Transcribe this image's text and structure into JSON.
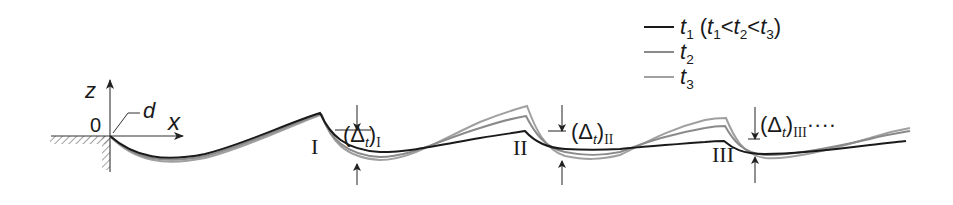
{
  "diagram": {
    "type": "water-surface profile over step/steps at successive times",
    "axes": {
      "z_label": "z",
      "x_label": "x",
      "origin_label": "0",
      "depth_label": "d"
    },
    "step_labels": [
      "I",
      "II",
      "III"
    ],
    "delta_labels": [
      {
        "base": "Δ",
        "sub_var": "t",
        "index": "I",
        "suffix": ""
      },
      {
        "base": "Δ",
        "sub_var": "t",
        "index": "II",
        "suffix": ""
      },
      {
        "base": "Δ",
        "sub_var": "t",
        "index": "III",
        "suffix": "····"
      }
    ],
    "legend": [
      {
        "var": "t",
        "sub": "1",
        "note": "(t1 < t2 < t3)",
        "color": "#1a1a1a"
      },
      {
        "var": "t",
        "sub": "2",
        "note": "",
        "color": "#8c8c8c"
      },
      {
        "var": "t",
        "sub": "3",
        "note": "",
        "color": "#9a9a9a"
      }
    ],
    "legend_note_parts": {
      "open": "(",
      "t1": "t",
      "s1": "1",
      "lt1": "<",
      "t2": "t",
      "s2": "2",
      "lt2": "<",
      "t3": "t",
      "s3": "3",
      "close": ")"
    },
    "colors": {
      "t1": "#1a1a1a",
      "t2": "#8a8a8a",
      "t3": "#a0a0a0",
      "axis": "#333333",
      "hatch": "#777777"
    }
  }
}
